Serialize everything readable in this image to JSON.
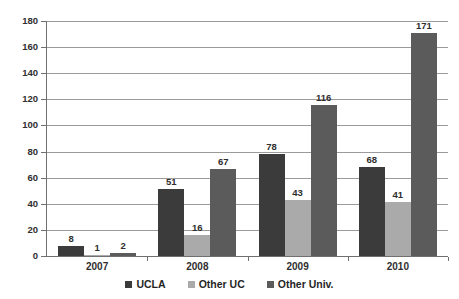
{
  "chart_data": {
    "type": "bar",
    "title": "",
    "subtitle": "",
    "xlabel": "",
    "ylabel": "",
    "categories": [
      "2007",
      "2008",
      "2009",
      "2010"
    ],
    "series": [
      {
        "name": "UCLA",
        "color": "#383838",
        "values": [
          8,
          51,
          78,
          68
        ]
      },
      {
        "name": "Other UC",
        "color": "#a9a9a9",
        "values": [
          1,
          16,
          43,
          41
        ]
      },
      {
        "name": "Other Univ.",
        "color": "#585858",
        "values": [
          2,
          67,
          116,
          171
        ]
      }
    ],
    "ylim": [
      0,
      180
    ],
    "ytick_step": 20,
    "yticks": [
      0,
      20,
      40,
      60,
      80,
      100,
      120,
      140,
      160,
      180
    ],
    "ytick_labels": [
      "0",
      "20",
      "40",
      "60",
      "80",
      "100",
      "120",
      "140",
      "160",
      "180"
    ],
    "grid": true,
    "grid_axis": "y",
    "legend_position": "bottom",
    "data_labels": true,
    "bar_group_gap": true,
    "background_color": "#ffffff",
    "gridline_color": "#9a9a9a",
    "axis_color": "#6e6e6e",
    "text_color": "#2b2b2b"
  }
}
